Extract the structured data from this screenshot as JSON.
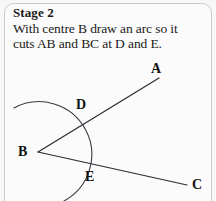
{
  "card": {
    "title": "Stage 2",
    "instruction_line_1": "With centre B draw an arc so it",
    "instruction_line_2": "cuts AB and BC at D and E.",
    "background_color": "#fbfbfb",
    "border_color": "#c9c9c9"
  },
  "diagram": {
    "name": "angle-bisector-construction-stage-2",
    "stroke_color": "#2b2b33",
    "arc_color": "#3a3a42",
    "label_color": "#111111",
    "points": [
      {
        "id": "A",
        "label": "A",
        "label_x": 151,
        "label_y": 62,
        "x": 159,
        "y": 78
      },
      {
        "id": "B",
        "label": "B",
        "label_x": 18,
        "label_y": 145,
        "x": 38,
        "y": 152
      },
      {
        "id": "C",
        "label": "C",
        "label_x": 192,
        "label_y": 178,
        "x": 187,
        "y": 185
      },
      {
        "id": "D",
        "label": "D",
        "label_x": 76,
        "label_y": 98,
        "x": 85,
        "y": 124
      },
      {
        "id": "E",
        "label": "E",
        "label_x": 85,
        "label_y": 170,
        "x": 84,
        "y": 163
      }
    ],
    "segments": [
      {
        "id": "BA",
        "from": "B",
        "to": "A"
      },
      {
        "id": "BC",
        "from": "B",
        "to": "C"
      }
    ],
    "arc": {
      "center": "B",
      "center_x": 38,
      "center_y": 152,
      "radius": 50,
      "start_x": 14,
      "start_y": 108,
      "end_x": 64,
      "end_y": 201
    }
  }
}
